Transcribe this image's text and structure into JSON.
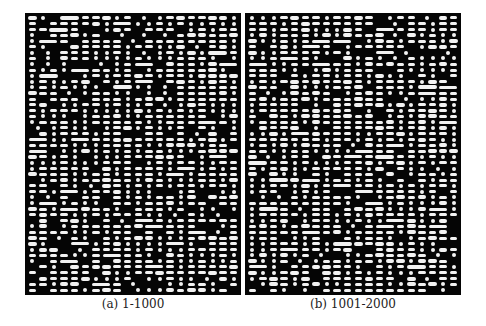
{
  "figure": {
    "panels": [
      {
        "id": "a",
        "caption": "(a) 1-1000",
        "columns": 20,
        "rows": 48,
        "seed": 7
      },
      {
        "id": "b",
        "caption": "(b) 1-1001-2000",
        "columns": 20,
        "rows": 48,
        "seed": 19
      }
    ],
    "colors": {
      "background": "#050505",
      "mark": "#f2f2f2",
      "page": "#ffffff"
    }
  },
  "chart_data": [
    {
      "type": "heatmap",
      "title": "(a) 1-1000",
      "xlabel": "",
      "ylabel": "",
      "grid": false,
      "description": "binary pattern matrix, white marks (dots/dashes/bars) on black background",
      "columns": 20,
      "rows": 48
    },
    {
      "type": "heatmap",
      "title": "(b) 1001-2000",
      "xlabel": "",
      "ylabel": "",
      "grid": false,
      "description": "binary pattern matrix, white marks (dots/dashes/bars) on black background",
      "columns": 20,
      "rows": 48
    }
  ]
}
